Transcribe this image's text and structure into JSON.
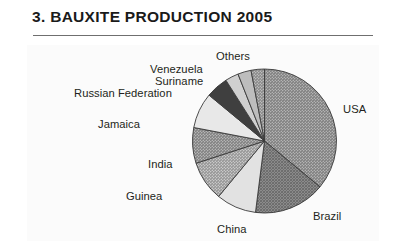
{
  "document": {
    "title": "3. BAUXITE PRODUCTION 2005",
    "section_number": "3."
  },
  "chart_data": {
    "type": "pie",
    "title": "3. BAUXITE PRODUCTION 2005",
    "subtitle": "",
    "xlabel": "",
    "ylabel": "",
    "unit": "share of world bauxite production (%)",
    "legend_position": "callout-labels",
    "grid": false,
    "start_angle_deg": 0,
    "direction": "clockwise",
    "categories": [
      "USA",
      "Brazil",
      "China",
      "Guinea",
      "India",
      "Jamaica",
      "Russian Federation",
      "Suriname",
      "Venezuela",
      "Others"
    ],
    "values": [
      36,
      16,
      9,
      9,
      8,
      8,
      5,
      3,
      3,
      3
    ],
    "slices": [
      {
        "label": "USA",
        "value": 36,
        "start_deg": 0,
        "end_deg": 129.6,
        "fill": "#8c8c8c",
        "pattern": "fine-hatch"
      },
      {
        "label": "Brazil",
        "value": 16,
        "start_deg": 129.6,
        "end_deg": 187.2,
        "fill": "#7d7d7d",
        "pattern": "cross-hatch"
      },
      {
        "label": "China",
        "value": 9,
        "start_deg": 187.2,
        "end_deg": 219.6,
        "fill": "#e2e2e2",
        "pattern": "none"
      },
      {
        "label": "Guinea",
        "value": 9,
        "start_deg": 219.6,
        "end_deg": 252.0,
        "fill": "#aeaeae",
        "pattern": "fine-hatch"
      },
      {
        "label": "India",
        "value": 8,
        "start_deg": 252.0,
        "end_deg": 280.8,
        "fill": "#8f8f8f",
        "pattern": "fine-hatch"
      },
      {
        "label": "Jamaica",
        "value": 8,
        "start_deg": 280.8,
        "end_deg": 309.6,
        "fill": "#e8e8e8",
        "pattern": "none"
      },
      {
        "label": "Russian Federation",
        "value": 5,
        "start_deg": 309.6,
        "end_deg": 327.6,
        "fill": "#3f3f3f",
        "pattern": "none"
      },
      {
        "label": "Suriname",
        "value": 3,
        "start_deg": 327.6,
        "end_deg": 338.4,
        "fill": "#d0d0d0",
        "pattern": "none"
      },
      {
        "label": "Venezuela",
        "value": 3,
        "start_deg": 338.4,
        "end_deg": 349.2,
        "fill": "#bdbdbd",
        "pattern": "none"
      },
      {
        "label": "Others",
        "value": 3,
        "start_deg": 349.2,
        "end_deg": 360.0,
        "fill": "#9a9a9a",
        "pattern": "fine-hatch"
      }
    ]
  },
  "labels": {
    "usa": "USA",
    "brazil": "Brazil",
    "china": "China",
    "guinea": "Guinea",
    "india": "India",
    "jamaica": "Jamaica",
    "russian_federation": "Russian Federation",
    "suriname": "Suriname",
    "venezuela": "Venezuela",
    "others": "Others"
  },
  "colors": {
    "page_background": "#ffffff",
    "panel_background": "#fbfbfb",
    "text": "#231f20",
    "rule": "#6f6f6f",
    "slice_outline": "#3a3a3a"
  }
}
